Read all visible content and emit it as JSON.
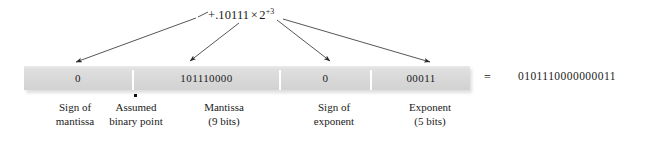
{
  "figure": {
    "formula": {
      "mantissa_part": "+.10111",
      "times_symbol": "×",
      "base": "2",
      "exponent": "+3"
    },
    "fields": [
      {
        "name": "sign-of-mantissa",
        "value": "0",
        "caption_line1": "Sign of",
        "caption_line2": "mantissa"
      },
      {
        "name": "mantissa",
        "value": "101110000",
        "caption_line1": "Mantissa",
        "caption_line2": "(9 bits)"
      },
      {
        "name": "sign-of-exponent",
        "value": "0",
        "caption_line1": "Sign of",
        "caption_line2": "exponent"
      },
      {
        "name": "exponent",
        "value": "00011",
        "caption_line1": "Exponent",
        "caption_line2": "(5 bits)"
      }
    ],
    "binary_point_caption": {
      "line1": "Assumed",
      "line2": "binary point"
    },
    "equals_symbol": "=",
    "packed_word": "0101110000000011",
    "colors": {
      "bar_fill": "#dcdcdc",
      "divider": "#ffffff",
      "text": "#1a1a1a",
      "arrow": "#2b2b2b",
      "background": "#ffffff"
    }
  }
}
